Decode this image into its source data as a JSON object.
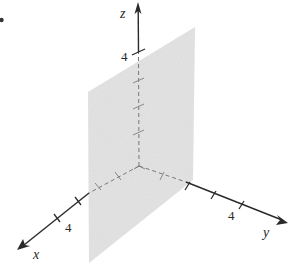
{
  "figure": {
    "type": "3d-coordinate-plane",
    "colors": {
      "axis": "#2a2a2a",
      "plane_fill": "#e3e3e3",
      "background": "#ffffff"
    },
    "axes": {
      "x": {
        "label": "x",
        "tick_label": "4"
      },
      "y": {
        "label": "y",
        "tick_label": "4"
      },
      "z": {
        "label": "z",
        "tick_label": "4"
      }
    },
    "corner_mark": "•"
  }
}
